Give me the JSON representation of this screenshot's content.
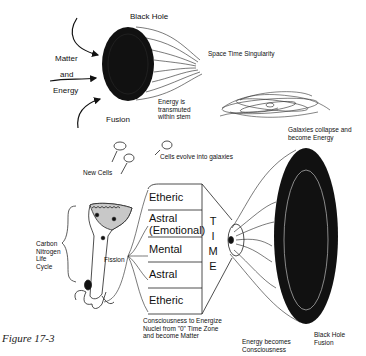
{
  "figure_caption": "Figure 17-3",
  "top": {
    "black_hole_label": "Black Hole",
    "inputs": [
      "Matter",
      "and",
      "Energy"
    ],
    "fusion_label": "Fusion",
    "space_time_label": "Space Time Singularity",
    "energy_transmuted": "Energy is\ntransmuted\nwithin stem",
    "galaxies_collapse": "Galaxies collapse and\nbecome Energy",
    "new_cells_label": "New Cells",
    "cells_evolve_label": "Cells evolve into galaxies"
  },
  "bottom": {
    "cycle_label": "Carbon\nNitrogen\nLife\nCycle",
    "fission_label": "Fission",
    "layers": [
      "Etheric",
      "Astral\n(Emotional)",
      "Mental",
      "Astral",
      "Etheric"
    ],
    "time_letters": [
      "T",
      "I",
      "M",
      "E"
    ],
    "consciousness_note": "Consciousness to Energize\nNuclei from \"0\" Time Zone\nand become Matter",
    "energy_becomes": "Energy becomes\nConsciousness",
    "black_hole_fusion": "Black Hole\nFusion"
  },
  "colors": {
    "ink": "#111111",
    "background": "#ffffff",
    "cell_shade": "#c8c8c8"
  }
}
